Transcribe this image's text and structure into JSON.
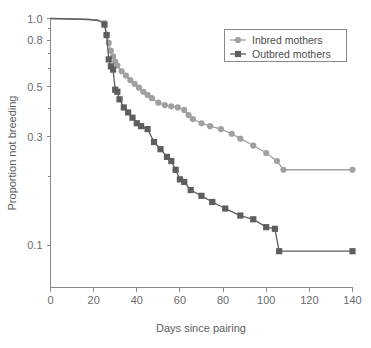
{
  "chart_data": {
    "type": "line",
    "title": "",
    "subtitle": "",
    "xlabel": "Days since pairing",
    "ylabel": "Proportion not breeding",
    "yscale": "log",
    "xlim": [
      0,
      140
    ],
    "ylim": [
      0.065,
      1.0
    ],
    "grid": false,
    "legend_position": "top-right",
    "xticks": [
      0,
      20,
      40,
      60,
      80,
      100,
      120,
      140
    ],
    "xtick_labels": [
      "0",
      "20",
      "40",
      "60",
      "80",
      "100",
      "120",
      "140"
    ],
    "yticks": [
      1.0,
      0.8,
      0.5,
      0.3,
      0.1
    ],
    "ytick_labels": [
      "1.0",
      "0.8",
      "0.5",
      "0.3",
      "0.1"
    ],
    "yminor_ticks": [
      0.9,
      0.7,
      0.6,
      0.4,
      0.2
    ],
    "series": [
      {
        "name": "Inbred mothers",
        "color": "#a0a0a0",
        "marker": "circle",
        "x": [
          0,
          10,
          18,
          22,
          24,
          25,
          26,
          27,
          28,
          29,
          30,
          31,
          33,
          35,
          37,
          39,
          41,
          43,
          45,
          47,
          50,
          53,
          56,
          59,
          62,
          64,
          66,
          70,
          74,
          79,
          84,
          88,
          94,
          100,
          105,
          108,
          140
        ],
        "y": [
          1.0,
          0.995,
          0.99,
          0.985,
          0.97,
          0.955,
          0.85,
          0.78,
          0.72,
          0.68,
          0.645,
          0.62,
          0.585,
          0.56,
          0.535,
          0.515,
          0.495,
          0.475,
          0.46,
          0.445,
          0.425,
          0.415,
          0.41,
          0.405,
          0.395,
          0.375,
          0.36,
          0.345,
          0.335,
          0.325,
          0.31,
          0.295,
          0.275,
          0.255,
          0.235,
          0.215,
          0.215
        ]
      },
      {
        "name": "Outbred mothers",
        "color": "#5e5e5e",
        "marker": "square",
        "x": [
          0,
          10,
          18,
          22,
          24,
          25,
          26,
          27,
          28,
          29,
          30,
          31,
          32,
          34,
          36,
          38,
          40,
          42,
          45,
          48,
          51,
          54,
          56,
          58,
          60,
          62,
          65,
          70,
          75,
          81,
          88,
          94,
          100,
          104,
          106,
          140
        ],
        "y": [
          1.0,
          0.995,
          0.99,
          0.98,
          0.96,
          0.94,
          0.845,
          0.66,
          0.615,
          0.595,
          0.485,
          0.475,
          0.44,
          0.405,
          0.385,
          0.365,
          0.345,
          0.335,
          0.325,
          0.285,
          0.265,
          0.245,
          0.235,
          0.215,
          0.195,
          0.19,
          0.175,
          0.165,
          0.155,
          0.145,
          0.135,
          0.13,
          0.12,
          0.118,
          0.094,
          0.094
        ]
      }
    ]
  },
  "legend": {
    "entries": [
      {
        "label": "Inbred mothers",
        "marker": "circle-marker",
        "color": "#a0a0a0"
      },
      {
        "label": "Outbred mothers",
        "marker": "square-marker",
        "color": "#5e5e5e"
      }
    ]
  },
  "axes": {
    "x_title": "Days since pairing",
    "y_title": "Proportion not breeding"
  }
}
